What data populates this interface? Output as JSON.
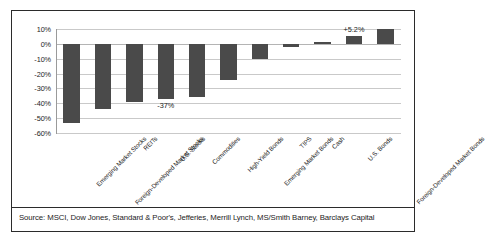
{
  "chart_data": {
    "type": "bar",
    "title": "",
    "xlabel": "",
    "ylabel": "",
    "ylim": [
      -60,
      10
    ],
    "grid": true,
    "legend": "none",
    "ytick_labels": [
      "10%",
      "0%",
      "-10%",
      "-20%",
      "-30%",
      "-40%",
      "-50%",
      "-60%"
    ],
    "ytick_values": [
      10,
      0,
      -10,
      -20,
      -30,
      -40,
      -50,
      -60
    ],
    "categories": [
      "Emerging Market Stocks",
      "Foreign-Developed Market Stocks",
      "REITs",
      "U.S. Stocks",
      "Commodities",
      "High-Yield Bonds",
      "Emerging Market Bonds",
      "TIPS",
      "Cash",
      "U.S. Bonds",
      "Foreign-Developed Market Bonds"
    ],
    "values": [
      -53,
      -44,
      -39,
      -37,
      -36,
      -24,
      -10,
      -2,
      1,
      5.2,
      10
    ],
    "bar_color": "#4a4a4a",
    "annotations": [
      {
        "category": "U.S. Stocks",
        "text": "-37%",
        "position": "below-bar"
      },
      {
        "category": "U.S. Bonds",
        "text": "+5.2%",
        "position": "above-bar"
      }
    ]
  },
  "footer": {
    "source_note": "Source:  MSCI, Dow Jones, Standard & Poor's, Jefferies, Merrill Lynch, MS/Smith Barney, Barclays Capital"
  }
}
